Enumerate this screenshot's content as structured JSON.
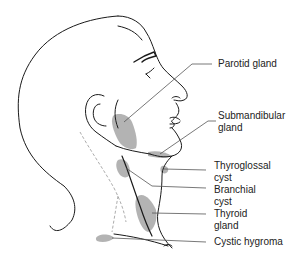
{
  "diagram": {
    "type": "anatomical-illustration",
    "colors": {
      "line": "#1a1a1a",
      "shading": "#9a9a9a",
      "leader": "#555555",
      "background": "#ffffff"
    },
    "labels": [
      {
        "id": "parotid",
        "lines": [
          "Parotid gland"
        ]
      },
      {
        "id": "submandibular",
        "lines": [
          "Submandibular",
          "gland"
        ]
      },
      {
        "id": "thyroglossal",
        "lines": [
          "Thyroglossal",
          "cyst"
        ]
      },
      {
        "id": "branchial",
        "lines": [
          "Branchial",
          "cyst"
        ]
      },
      {
        "id": "thyroid",
        "lines": [
          "Thyroid",
          "gland"
        ]
      },
      {
        "id": "cystic",
        "lines": [
          "Cystic hygroma"
        ]
      }
    ]
  }
}
